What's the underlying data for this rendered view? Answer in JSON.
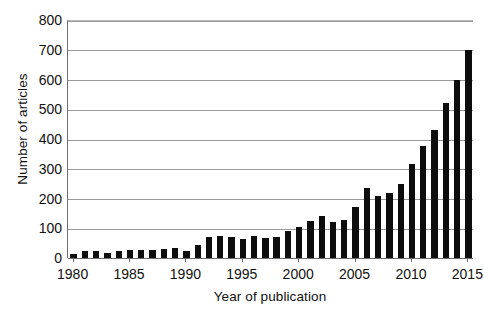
{
  "chart_data": {
    "type": "bar",
    "title": "",
    "subtitle": "",
    "xlabel": "Year of publication",
    "ylabel": "Number of articles",
    "categories": [
      "1980",
      "1981",
      "1982",
      "1983",
      "1984",
      "1985",
      "1986",
      "1987",
      "1988",
      "1989",
      "1990",
      "1991",
      "1992",
      "1993",
      "1994",
      "1995",
      "1996",
      "1997",
      "1998",
      "1999",
      "2000",
      "2001",
      "2002",
      "2003",
      "2004",
      "2005",
      "2006",
      "2007",
      "2008",
      "2009",
      "2010",
      "2011",
      "2012",
      "2013",
      "2014",
      "2015"
    ],
    "values": [
      12,
      22,
      24,
      16,
      25,
      26,
      27,
      26,
      30,
      32,
      22,
      45,
      70,
      73,
      70,
      65,
      75,
      67,
      70,
      90,
      105,
      125,
      140,
      122,
      128,
      170,
      237,
      210,
      220,
      250,
      315,
      375,
      430,
      520,
      600,
      700
    ],
    "bar_color": "#0d0d0d",
    "xlim": [
      1979.5,
      2015.5
    ],
    "ylim": [
      0,
      800
    ],
    "ytick_values": [
      0,
      100,
      200,
      300,
      400,
      500,
      600,
      700,
      800
    ],
    "ytick_labels": [
      "0",
      "100",
      "200",
      "300",
      "400",
      "500",
      "600",
      "700",
      "800"
    ],
    "xtick_values": [
      1980,
      1985,
      1990,
      1995,
      2000,
      2005,
      2010,
      2015
    ],
    "xtick_labels": [
      "1980",
      "1985",
      "1990",
      "1995",
      "2000",
      "2005",
      "2010",
      "2015"
    ],
    "grid": "horizontal",
    "legend": "none",
    "legend_position": "none",
    "annotations": [],
    "note_last_bar": "The 2015 bar reaches the top of the plot area at 800."
  }
}
